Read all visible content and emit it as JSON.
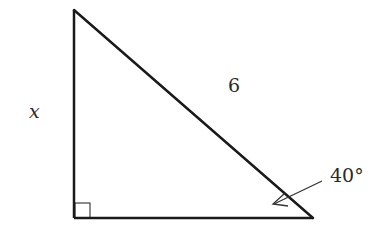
{
  "diagram": {
    "type": "right-triangle",
    "labels": {
      "vertical_side": "x",
      "hypotenuse": "6",
      "angle": "40°"
    },
    "right_angle_marker": true,
    "colors": {
      "stroke": "#1a1a1a",
      "text": "#2a2a2a",
      "background": "#ffffff"
    }
  }
}
